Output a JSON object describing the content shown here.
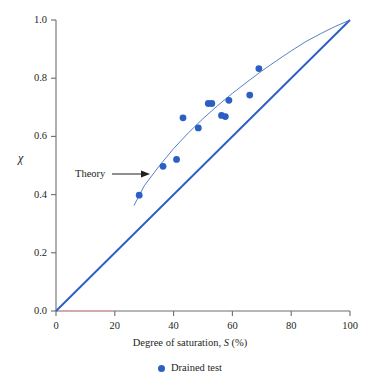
{
  "chart_data": {
    "type": "scatter",
    "title": "",
    "xlabel": "Degree of saturation, S (%)",
    "xlabel_main": "Degree of saturation,",
    "xlabel_symbol": "S",
    "xlabel_units": "(%)",
    "ylabel": "χ",
    "xlim": [
      0,
      100
    ],
    "ylim": [
      0.0,
      1.0
    ],
    "xticks": [
      0,
      20,
      40,
      60,
      80,
      100
    ],
    "xtick_labels": [
      "0",
      "20",
      "40",
      "60",
      "80",
      "100"
    ],
    "yticks": [
      0.0,
      0.2,
      0.4,
      0.6,
      0.8,
      1.0
    ],
    "ytick_labels": [
      "0.0",
      "0.2",
      "0.4",
      "0.6",
      "0.8",
      "1.0"
    ],
    "grid": false,
    "legend_position": "below-axes",
    "series": [
      {
        "name": "Drained test",
        "type": "scatter",
        "color": "#2b5fc4",
        "marker": "circle",
        "points": [
          {
            "x": 28.3,
            "y": 0.398
          },
          {
            "x": 36.4,
            "y": 0.497
          },
          {
            "x": 41.0,
            "y": 0.521
          },
          {
            "x": 43.2,
            "y": 0.664
          },
          {
            "x": 48.4,
            "y": 0.629
          },
          {
            "x": 51.8,
            "y": 0.713
          },
          {
            "x": 53.0,
            "y": 0.713
          },
          {
            "x": 56.3,
            "y": 0.672
          },
          {
            "x": 57.6,
            "y": 0.668
          },
          {
            "x": 58.8,
            "y": 0.724
          },
          {
            "x": 65.9,
            "y": 0.742
          },
          {
            "x": 69.0,
            "y": 0.833
          }
        ]
      },
      {
        "name": "Theory",
        "type": "line",
        "color": "#4472c4",
        "annotation": "Theory",
        "points": [
          {
            "x": 26.5,
            "y": 0.362
          },
          {
            "x": 30.0,
            "y": 0.43
          },
          {
            "x": 35.0,
            "y": 0.497
          },
          {
            "x": 40.0,
            "y": 0.558
          },
          {
            "x": 45.0,
            "y": 0.612
          },
          {
            "x": 50.0,
            "y": 0.661
          },
          {
            "x": 55.0,
            "y": 0.706
          },
          {
            "x": 60.0,
            "y": 0.748
          },
          {
            "x": 65.0,
            "y": 0.787
          },
          {
            "x": 70.0,
            "y": 0.825
          },
          {
            "x": 75.0,
            "y": 0.86
          },
          {
            "x": 80.0,
            "y": 0.894
          },
          {
            "x": 85.0,
            "y": 0.926
          },
          {
            "x": 90.0,
            "y": 0.953
          },
          {
            "x": 95.0,
            "y": 0.978
          },
          {
            "x": 100.0,
            "y": 1.0
          }
        ]
      },
      {
        "name": "One-to-one line",
        "type": "line",
        "color": "#2b5fc4",
        "points": [
          {
            "x": 0,
            "y": 0.0
          },
          {
            "x": 100,
            "y": 1.0
          }
        ]
      }
    ],
    "annotations": [
      {
        "text": "Theory",
        "target_x": 32.0,
        "target_y": 0.452,
        "arrow": true
      }
    ],
    "legend": [
      {
        "label": "Drained test",
        "marker": "circle",
        "color": "#2b5fc4"
      }
    ],
    "axis_color": "#6e6e6e",
    "axis_highlight_color": "#e8a0a0"
  }
}
